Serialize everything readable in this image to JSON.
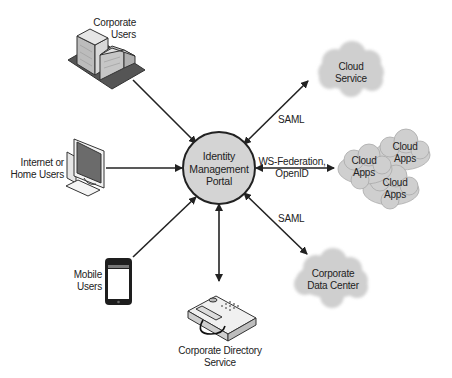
{
  "diagram": {
    "center": {
      "label_lines": [
        "Identity",
        "Management",
        "Portal"
      ],
      "fill": "#d4d4d4",
      "stroke": "#222222"
    },
    "nodes": {
      "corporate_users": {
        "label_lines": [
          "Corporate",
          "Users"
        ],
        "icon": "office-building-icon"
      },
      "home_users": {
        "label_lines": [
          "Internet or",
          "Home Users"
        ],
        "icon": "desktop-computer-icon"
      },
      "mobile_users": {
        "label_lines": [
          "Mobile",
          "Users"
        ],
        "icon": "smartphone-icon"
      },
      "directory_service": {
        "label_lines": [
          "Corporate Directory",
          "Service"
        ],
        "icon": "telephone-icon"
      },
      "cloud_service": {
        "label_lines": [
          "Cloud",
          "Service"
        ],
        "icon": "cloud-icon"
      },
      "cloud_apps": [
        {
          "label_lines": [
            "Cloud",
            "Apps"
          ],
          "icon": "cloud-icon"
        },
        {
          "label_lines": [
            "Cloud",
            "Apps"
          ],
          "icon": "cloud-icon"
        },
        {
          "label_lines": [
            "Cloud",
            "Apps"
          ],
          "icon": "cloud-icon"
        }
      ],
      "data_center": {
        "label_lines": [
          "Corporate",
          "Data Center"
        ],
        "icon": "cloud-icon"
      }
    },
    "edges": [
      {
        "from": "Corporate Users",
        "to": "Identity Management Portal",
        "direction": "one-way",
        "label": ""
      },
      {
        "from": "Internet or Home Users",
        "to": "Identity Management Portal",
        "direction": "one-way",
        "label": ""
      },
      {
        "from": "Mobile Users",
        "to": "Identity Management Portal",
        "direction": "one-way",
        "label": ""
      },
      {
        "from": "Identity Management Portal",
        "to": "Corporate Directory Service",
        "direction": "two-way",
        "label": ""
      },
      {
        "from": "Identity Management Portal",
        "to": "Cloud Service",
        "direction": "two-way",
        "label": "SAML"
      },
      {
        "from": "Identity Management Portal",
        "to": "Cloud Apps",
        "direction": "two-way",
        "label_lines": [
          "WS-Federation,",
          "OpenID"
        ]
      },
      {
        "from": "Identity Management Portal",
        "to": "Corporate Data Center",
        "direction": "two-way",
        "label": "SAML"
      }
    ],
    "colors": {
      "cloud_fill": "#cfcfcf",
      "line": "#222222",
      "icon_gray": "#bdbdbd",
      "icon_dark": "#555555"
    }
  }
}
